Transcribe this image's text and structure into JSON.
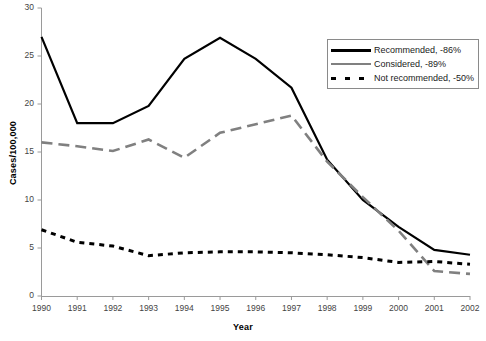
{
  "chart_data": {
    "type": "line",
    "title": "",
    "xlabel": "Year",
    "ylabel": "Cases/100,000",
    "categories": [
      "1990",
      "1991",
      "1992",
      "1993",
      "1994",
      "1995",
      "1996",
      "1997",
      "1998",
      "1999",
      "2000",
      "2001",
      "2002"
    ],
    "x": [
      1990,
      1991,
      1992,
      1993,
      1994,
      1995,
      1996,
      1997,
      1998,
      1999,
      2000,
      2001,
      2002
    ],
    "xlim": [
      1990,
      2002
    ],
    "ylim": [
      0,
      30
    ],
    "yticks": [
      0,
      5,
      10,
      15,
      20,
      25,
      30
    ],
    "grid": false,
    "legend_position": "top-right",
    "series": [
      {
        "name": "Recommended, -86%",
        "short_name": "Recommended",
        "change_pct": "-86%",
        "style": "solid",
        "color": "#000000",
        "values": [
          27.0,
          18.0,
          18.0,
          19.8,
          24.7,
          26.9,
          24.7,
          21.7,
          14.2,
          10.0,
          7.2,
          4.8,
          4.3
        ]
      },
      {
        "name": "Considered, -89%",
        "short_name": "Considered",
        "change_pct": "-89%",
        "style": "dashed",
        "color": "#808080",
        "values": [
          16.0,
          15.6,
          15.1,
          16.3,
          14.4,
          17.0,
          17.9,
          18.8,
          14.0,
          10.3,
          6.8,
          2.6,
          2.3
        ]
      },
      {
        "name": "Not recommended, -50%",
        "short_name": "Not recommended",
        "change_pct": "-50%",
        "style": "dotted",
        "color": "#000000",
        "values": [
          6.9,
          5.6,
          5.2,
          4.2,
          4.5,
          4.6,
          4.6,
          4.5,
          4.3,
          4.0,
          3.5,
          3.6,
          3.3
        ]
      }
    ],
    "axis_color": "#9a9a9a",
    "text_color": "#333333"
  },
  "legend": {
    "entries": [
      {
        "label": "Recommended, -86%",
        "swatch": "solid-black-line"
      },
      {
        "label": "Considered, -89%",
        "swatch": "dashed-gray-line"
      },
      {
        "label": "Not recommended, -50%",
        "swatch": "dotted-black-line"
      }
    ]
  },
  "axes": {
    "y_tick_labels": [
      "30",
      "25",
      "20",
      "15",
      "10",
      "5",
      "0"
    ],
    "x_tick_labels": [
      "1990",
      "1991",
      "1992",
      "1993",
      "1994",
      "1995",
      "1996",
      "1997",
      "1998",
      "1999",
      "2000",
      "2001",
      "2002"
    ],
    "y_title": "Cases/100,000",
    "x_title": "Year"
  }
}
